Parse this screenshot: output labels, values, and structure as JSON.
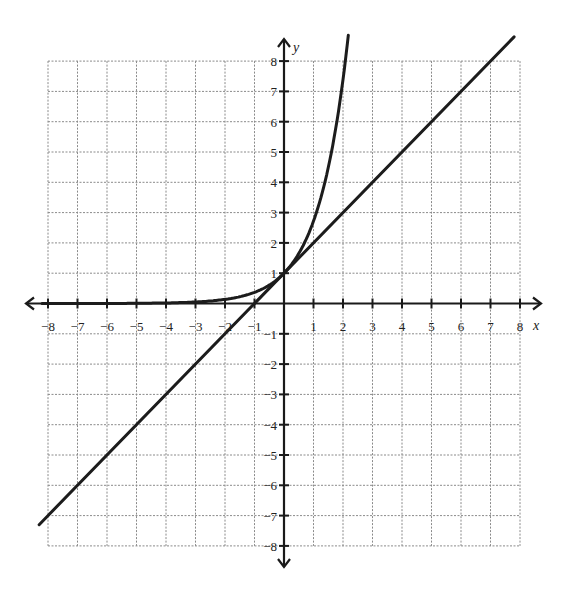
{
  "chart_data": {
    "type": "line",
    "title": "",
    "xlabel": "x",
    "ylabel": "y",
    "xlim": [
      -8,
      8
    ],
    "ylim": [
      -8,
      8
    ],
    "grid": true,
    "legend": null,
    "x_ticks": [
      -8,
      -7,
      -6,
      -5,
      -4,
      -3,
      -2,
      -1,
      1,
      2,
      3,
      4,
      5,
      6,
      7,
      8
    ],
    "y_ticks": [
      -8,
      -7,
      -6,
      -5,
      -4,
      -3,
      -2,
      -1,
      1,
      2,
      3,
      4,
      5,
      6,
      7,
      8
    ],
    "series": [
      {
        "name": "exponential curve",
        "equation": "y = e^x",
        "x": [
          -8,
          -4,
          -3,
          -2,
          -1,
          0,
          0.5,
          1,
          1.5,
          2,
          2.1
        ],
        "y": [
          0.0003,
          0.018,
          0.05,
          0.14,
          0.37,
          1,
          1.65,
          2.72,
          4.48,
          7.39,
          8.9
        ]
      },
      {
        "name": "line",
        "equation": "y = x + 1",
        "x": [
          -8.3,
          -1,
          0,
          7,
          7.8
        ],
        "y": [
          -7.3,
          0,
          1,
          8,
          8.8
        ]
      }
    ]
  },
  "labels": {
    "x_axis": "x",
    "y_axis": "y"
  }
}
